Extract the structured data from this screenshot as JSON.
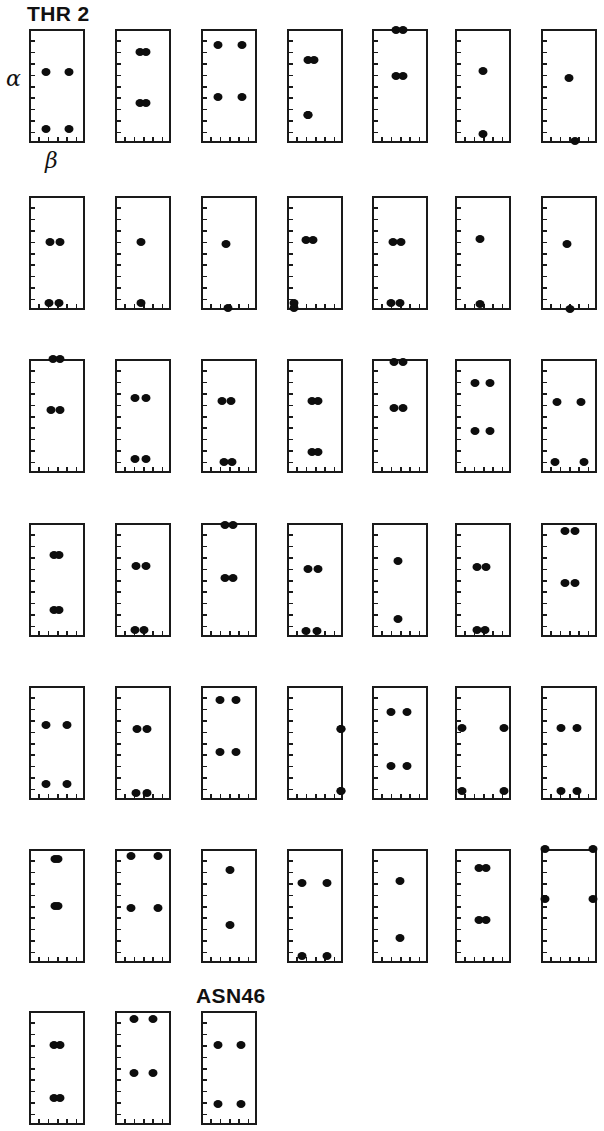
{
  "figure": {
    "title_label": "THR 2",
    "end_label": "ASN46",
    "axis_y_label": "α",
    "axis_x_label": "β",
    "dot_color": "#0d0d0d",
    "frame_color": "#1a1a1a",
    "background": "#ffffff",
    "residue_count": 45,
    "columns": 7,
    "rows": 7
  },
  "chart_data": {
    "type": "scatter",
    "title": "THR 2",
    "xlabel": "β",
    "ylabel": "α",
    "grid": false,
    "legend": "none",
    "xlim": [
      0,
      1
    ],
    "ylim": [
      0,
      1
    ],
    "panel_layout": {
      "columns": 7,
      "rows": 7,
      "last_row_panels": 3
    },
    "panels": [
      {
        "index": 1,
        "row": 1,
        "col": 1,
        "points": [
          [
            0.3,
            0.62
          ],
          [
            0.72,
            0.62
          ],
          [
            0.3,
            0.12
          ],
          [
            0.72,
            0.12
          ]
        ]
      },
      {
        "index": 2,
        "row": 1,
        "col": 2,
        "points": [
          [
            0.44,
            0.8
          ],
          [
            0.56,
            0.8
          ],
          [
            0.44,
            0.35
          ],
          [
            0.56,
            0.35
          ]
        ]
      },
      {
        "index": 3,
        "row": 1,
        "col": 3,
        "points": [
          [
            0.3,
            0.86
          ],
          [
            0.74,
            0.86
          ],
          [
            0.3,
            0.4
          ],
          [
            0.74,
            0.4
          ]
        ]
      },
      {
        "index": 4,
        "row": 1,
        "col": 4,
        "points": [
          [
            0.37,
            0.73
          ],
          [
            0.49,
            0.73
          ],
          [
            0.37,
            0.25
          ],
          [
            0.37,
            0.25
          ]
        ]
      },
      {
        "index": 5,
        "row": 1,
        "col": 5,
        "points": [
          [
            0.42,
            0.99
          ],
          [
            0.56,
            0.99
          ],
          [
            0.42,
            0.59
          ],
          [
            0.56,
            0.59
          ]
        ]
      },
      {
        "index": 6,
        "row": 1,
        "col": 6,
        "points": [
          [
            0.5,
            0.63
          ],
          [
            0.5,
            0.08
          ]
        ]
      },
      {
        "index": 7,
        "row": 1,
        "col": 7,
        "points": [
          [
            0.5,
            0.57
          ],
          [
            0.6,
            0.02
          ]
        ]
      },
      {
        "index": 8,
        "row": 2,
        "col": 1,
        "points": [
          [
            0.38,
            0.6
          ],
          [
            0.56,
            0.6
          ],
          [
            0.36,
            0.06
          ],
          [
            0.54,
            0.06
          ]
        ]
      },
      {
        "index": 9,
        "row": 2,
        "col": 2,
        "points": [
          [
            0.47,
            0.6
          ],
          [
            0.47,
            0.06
          ]
        ]
      },
      {
        "index": 10,
        "row": 2,
        "col": 3,
        "points": [
          [
            0.45,
            0.58
          ],
          [
            0.48,
            0.02
          ]
        ]
      },
      {
        "index": 11,
        "row": 2,
        "col": 4,
        "points": [
          [
            0.34,
            0.61
          ],
          [
            0.47,
            0.61
          ],
          [
            0.12,
            0.06
          ],
          [
            0.12,
            0.02
          ]
        ]
      },
      {
        "index": 12,
        "row": 2,
        "col": 5,
        "points": [
          [
            0.37,
            0.6
          ],
          [
            0.52,
            0.6
          ],
          [
            0.34,
            0.06
          ],
          [
            0.5,
            0.06
          ]
        ]
      },
      {
        "index": 13,
        "row": 2,
        "col": 6,
        "points": [
          [
            0.45,
            0.62
          ],
          [
            0.45,
            0.05
          ]
        ]
      },
      {
        "index": 14,
        "row": 2,
        "col": 7,
        "points": [
          [
            0.47,
            0.58
          ],
          [
            0.52,
            0.01
          ]
        ]
      },
      {
        "index": 15,
        "row": 3,
        "col": 1,
        "points": [
          [
            0.42,
            1.0
          ],
          [
            0.56,
            1.0
          ],
          [
            0.4,
            0.55
          ],
          [
            0.56,
            0.55
          ]
        ]
      },
      {
        "index": 16,
        "row": 3,
        "col": 2,
        "points": [
          [
            0.35,
            0.66
          ],
          [
            0.55,
            0.66
          ],
          [
            0.35,
            0.12
          ],
          [
            0.55,
            0.12
          ]
        ]
      },
      {
        "index": 17,
        "row": 3,
        "col": 3,
        "points": [
          [
            0.37,
            0.63
          ],
          [
            0.54,
            0.63
          ],
          [
            0.41,
            0.1
          ],
          [
            0.56,
            0.1
          ]
        ]
      },
      {
        "index": 18,
        "row": 3,
        "col": 4,
        "points": [
          [
            0.44,
            0.63
          ],
          [
            0.56,
            0.63
          ],
          [
            0.44,
            0.18
          ],
          [
            0.56,
            0.18
          ]
        ]
      },
      {
        "index": 19,
        "row": 3,
        "col": 5,
        "points": [
          [
            0.4,
            0.97
          ],
          [
            0.56,
            0.97
          ],
          [
            0.4,
            0.57
          ],
          [
            0.56,
            0.57
          ]
        ]
      },
      {
        "index": 20,
        "row": 3,
        "col": 6,
        "points": [
          [
            0.36,
            0.79
          ],
          [
            0.62,
            0.79
          ],
          [
            0.36,
            0.37
          ],
          [
            0.62,
            0.37
          ]
        ]
      },
      {
        "index": 21,
        "row": 3,
        "col": 7,
        "points": [
          [
            0.28,
            0.62
          ],
          [
            0.72,
            0.62
          ],
          [
            0.25,
            0.1
          ],
          [
            0.76,
            0.1
          ]
        ]
      },
      {
        "index": 22,
        "row": 4,
        "col": 1,
        "points": [
          [
            0.44,
            0.72
          ],
          [
            0.54,
            0.72
          ],
          [
            0.44,
            0.24
          ],
          [
            0.54,
            0.24
          ]
        ]
      },
      {
        "index": 23,
        "row": 4,
        "col": 2,
        "points": [
          [
            0.38,
            0.62
          ],
          [
            0.55,
            0.62
          ],
          [
            0.36,
            0.06
          ],
          [
            0.52,
            0.06
          ]
        ]
      },
      {
        "index": 24,
        "row": 4,
        "col": 3,
        "points": [
          [
            0.42,
            0.98
          ],
          [
            0.58,
            0.98
          ],
          [
            0.42,
            0.52
          ],
          [
            0.58,
            0.52
          ]
        ]
      },
      {
        "index": 25,
        "row": 4,
        "col": 4,
        "points": [
          [
            0.38,
            0.6
          ],
          [
            0.55,
            0.6
          ],
          [
            0.34,
            0.05
          ],
          [
            0.54,
            0.05
          ]
        ]
      },
      {
        "index": 26,
        "row": 4,
        "col": 5,
        "points": [
          [
            0.46,
            0.67
          ],
          [
            0.46,
            0.16
          ]
        ]
      },
      {
        "index": 27,
        "row": 4,
        "col": 6,
        "points": [
          [
            0.4,
            0.61
          ],
          [
            0.56,
            0.61
          ],
          [
            0.4,
            0.06
          ],
          [
            0.54,
            0.06
          ]
        ]
      },
      {
        "index": 28,
        "row": 4,
        "col": 7,
        "points": [
          [
            0.42,
            0.93
          ],
          [
            0.6,
            0.93
          ],
          [
            0.42,
            0.47
          ],
          [
            0.6,
            0.47
          ]
        ]
      },
      {
        "index": 29,
        "row": 5,
        "col": 1,
        "points": [
          [
            0.3,
            0.66
          ],
          [
            0.68,
            0.66
          ],
          [
            0.3,
            0.14
          ],
          [
            0.68,
            0.14
          ]
        ]
      },
      {
        "index": 30,
        "row": 5,
        "col": 2,
        "points": [
          [
            0.4,
            0.62
          ],
          [
            0.58,
            0.62
          ],
          [
            0.38,
            0.06
          ],
          [
            0.58,
            0.06
          ]
        ]
      },
      {
        "index": 31,
        "row": 5,
        "col": 3,
        "points": [
          [
            0.34,
            0.88
          ],
          [
            0.62,
            0.88
          ],
          [
            0.34,
            0.42
          ],
          [
            0.62,
            0.42
          ]
        ]
      },
      {
        "index": 32,
        "row": 5,
        "col": 4,
        "points": [
          [
            0.96,
            0.62
          ],
          [
            0.96,
            0.08
          ],
          [
            0.96,
            0.62
          ],
          [
            0.96,
            0.08
          ]
        ]
      },
      {
        "index": 33,
        "row": 5,
        "col": 5,
        "points": [
          [
            0.34,
            0.77
          ],
          [
            0.62,
            0.77
          ],
          [
            0.34,
            0.3
          ],
          [
            0.62,
            0.3
          ]
        ]
      },
      {
        "index": 34,
        "row": 5,
        "col": 6,
        "points": [
          [
            0.12,
            0.63
          ],
          [
            0.88,
            0.63
          ],
          [
            0.12,
            0.08
          ],
          [
            0.88,
            0.08
          ]
        ]
      },
      {
        "index": 35,
        "row": 5,
        "col": 7,
        "points": [
          [
            0.36,
            0.63
          ],
          [
            0.64,
            0.63
          ],
          [
            0.36,
            0.08
          ],
          [
            0.64,
            0.08
          ]
        ]
      },
      {
        "index": 36,
        "row": 6,
        "col": 1,
        "points": [
          [
            0.46,
            0.91
          ],
          [
            0.52,
            0.91
          ],
          [
            0.46,
            0.5
          ],
          [
            0.52,
            0.5
          ]
        ]
      },
      {
        "index": 37,
        "row": 6,
        "col": 2,
        "points": [
          [
            0.28,
            0.94
          ],
          [
            0.76,
            0.94
          ],
          [
            0.28,
            0.48
          ],
          [
            0.76,
            0.48
          ]
        ]
      },
      {
        "index": 38,
        "row": 6,
        "col": 3,
        "points": [
          [
            0.52,
            0.82
          ],
          [
            0.52,
            0.33
          ]
        ]
      },
      {
        "index": 39,
        "row": 6,
        "col": 4,
        "points": [
          [
            0.26,
            0.7
          ],
          [
            0.72,
            0.7
          ],
          [
            0.26,
            0.06
          ],
          [
            0.72,
            0.06
          ]
        ]
      },
      {
        "index": 40,
        "row": 6,
        "col": 5,
        "points": [
          [
            0.5,
            0.72
          ],
          [
            0.5,
            0.22
          ]
        ]
      },
      {
        "index": 41,
        "row": 6,
        "col": 6,
        "points": [
          [
            0.42,
            0.83
          ],
          [
            0.56,
            0.83
          ],
          [
            0.42,
            0.38
          ],
          [
            0.56,
            0.38
          ]
        ]
      },
      {
        "index": 42,
        "row": 6,
        "col": 7,
        "points": [
          [
            0.08,
            1.0
          ],
          [
            0.92,
            1.0
          ],
          [
            0.08,
            0.56
          ],
          [
            0.92,
            0.56
          ]
        ]
      },
      {
        "index": 43,
        "row": 7,
        "col": 1,
        "points": [
          [
            0.44,
            0.7
          ],
          [
            0.56,
            0.7
          ],
          [
            0.44,
            0.24
          ],
          [
            0.56,
            0.24
          ]
        ]
      },
      {
        "index": 44,
        "row": 7,
        "col": 2,
        "points": [
          [
            0.34,
            0.93
          ],
          [
            0.68,
            0.93
          ],
          [
            0.34,
            0.46
          ],
          [
            0.68,
            0.46
          ]
        ]
      },
      {
        "index": 45,
        "row": 7,
        "col": 3,
        "points": [
          [
            0.3,
            0.7
          ],
          [
            0.72,
            0.7
          ],
          [
            0.3,
            0.18
          ],
          [
            0.72,
            0.18
          ]
        ]
      }
    ]
  },
  "geometry": {
    "col_x": [
      29,
      115,
      201,
      287,
      372,
      455,
      541
    ],
    "row_y": [
      29,
      196,
      359,
      523,
      686,
      849,
      1011
    ],
    "panel_w": 56,
    "panel_h": 114,
    "tick_count_left": 9,
    "tick_count_bottom": 5
  },
  "labels": {
    "title_pos": {
      "x": 27,
      "y": 2
    },
    "end_pos": {
      "x": 196,
      "y": 984
    },
    "alpha_pos": {
      "x": 6,
      "y": 66
    },
    "beta_pos": {
      "x": 45,
      "y": 148
    }
  }
}
